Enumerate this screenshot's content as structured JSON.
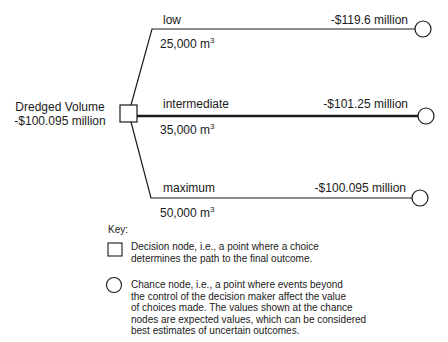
{
  "root": {
    "title": "Dredged Volume",
    "value": "-$100.095 million"
  },
  "branches": [
    {
      "name": "low",
      "volume": "25,000 m",
      "volume_exp": "3",
      "value": "-$119.6 million",
      "emphasis": false
    },
    {
      "name": "intermediate",
      "volume": "35,000 m",
      "volume_exp": "3",
      "value": "-$101.25 million",
      "emphasis": true
    },
    {
      "name": "maximum",
      "volume": "50,000 m",
      "volume_exp": "3",
      "value": "-$100.095 million",
      "emphasis": false
    }
  ],
  "key": {
    "title": "Key:",
    "decision": "Decision node, i.e., a point where a choice determines the path to the final outcome.",
    "decision_lines": [
      "Decision node, i.e., a point where a choice",
      "determines the path to the final outcome."
    ],
    "chance_lines": [
      "Chance node, i.e., a point where events beyond",
      "the control of the decision maker affect the value",
      "of choices made. The values shown at the chance",
      "nodes are expected values, which can be considered",
      "best estimates of uncertain outcomes."
    ]
  },
  "colors": {
    "line": "#1a1a1a",
    "background": "#ffffff"
  }
}
